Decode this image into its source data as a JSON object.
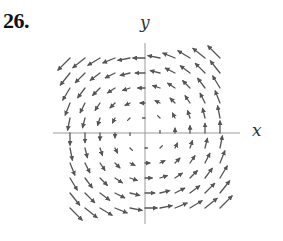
{
  "problem": {
    "number": "26."
  },
  "axes": {
    "x_label": "x",
    "y_label": "y",
    "color": "#9a9a9a"
  },
  "vector_field": {
    "description": "Counterclockwise rotational field F(x, y) = (-y, x)",
    "formula": "F(x,y) = (-y, x)",
    "origin_px": [
      145,
      133
    ],
    "grid_spacing_px": 15,
    "grid_range": [
      -5,
      5
    ],
    "arrow_scale_px_per_unit": 2.4,
    "arrow_color": "#555555",
    "x_axis_extent_px": [
      53,
      240
    ],
    "y_axis_extent_px": [
      43,
      224
    ]
  }
}
